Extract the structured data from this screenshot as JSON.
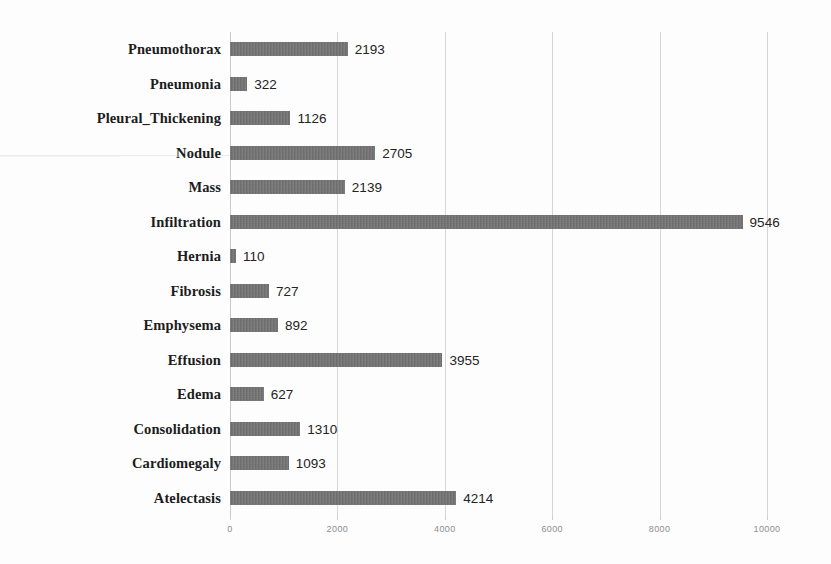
{
  "chart_data": {
    "type": "bar",
    "orientation": "horizontal",
    "title": "",
    "subtitle": "",
    "xlabel": "",
    "ylabel": "",
    "xlim": [
      0,
      10000
    ],
    "xticks": [
      0,
      2000,
      4000,
      6000,
      8000,
      10000
    ],
    "xtick_labels": [
      "0",
      "2000",
      "4000",
      "6000",
      "8000",
      "10000"
    ],
    "grid": true,
    "legend": false,
    "legend_position": "none",
    "data_labels": true,
    "bar_color": "#6f6f6f",
    "gridline_color": "#d6d6d6",
    "categories": [
      "Pneumothorax",
      "Pneumonia",
      "Pleural_Thickening",
      "Nodule",
      "Mass",
      "Infiltration",
      "Hernia",
      "Fibrosis",
      "Emphysema",
      "Effusion",
      "Edema",
      "Consolidation",
      "Cardiomegaly",
      "Atelectasis"
    ],
    "values": [
      2193,
      322,
      1126,
      2705,
      2139,
      9546,
      110,
      727,
      892,
      3955,
      627,
      1310,
      1093,
      4214
    ],
    "value_labels": [
      "2193",
      "322",
      "1126",
      "2705",
      "2139",
      "9546",
      "110",
      "727",
      "892",
      "3955",
      "627",
      "1310",
      "1093",
      "4214"
    ]
  }
}
